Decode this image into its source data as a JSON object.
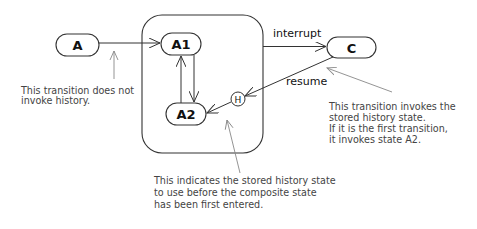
{
  "diagram": {
    "type": "uml-state-machine-history",
    "colors": {
      "line": "#333333",
      "pointer": "#888888",
      "text": "#111111",
      "note_text": "#444444",
      "background": "#ffffff"
    },
    "states": [
      {
        "id": "A",
        "label": "A"
      },
      {
        "id": "A1",
        "label": "A1"
      },
      {
        "id": "A2",
        "label": "A2"
      },
      {
        "id": "C",
        "label": "C"
      }
    ],
    "composite_state": {
      "contains": [
        "A1",
        "A2",
        "H"
      ]
    },
    "history_pseudostate": {
      "label": "H"
    },
    "transitions": [
      {
        "from": "A",
        "to": "A1",
        "label": ""
      },
      {
        "from": "A1",
        "to": "A2",
        "label": ""
      },
      {
        "from": "A2",
        "to": "A1",
        "label": ""
      },
      {
        "from": "composite",
        "to": "C",
        "label": "interrupt"
      },
      {
        "from": "C",
        "to": "H",
        "label": "resume"
      },
      {
        "from": "H",
        "to": "A2",
        "label": ""
      }
    ],
    "notes": {
      "no_history": [
        "This transition does not",
        "invoke history."
      ],
      "invokes_history": [
        "This transition invokes the",
        "stored history state.",
        "If it is the first transition,",
        "it invokes state A2."
      ],
      "default_history": [
        "This indicates the stored history state",
        "to use before the composite state",
        "has been first entered."
      ]
    }
  }
}
